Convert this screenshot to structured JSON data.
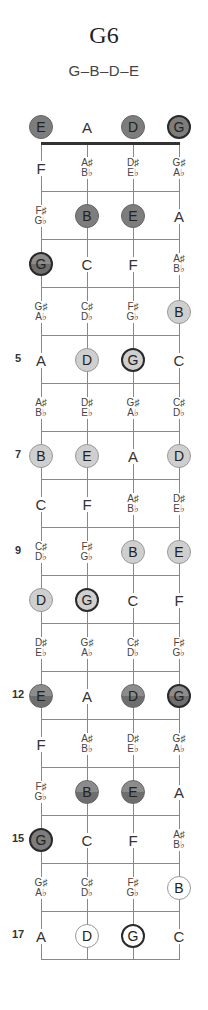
{
  "header": {
    "title": "G6",
    "notes_formula": "G–B–D–E"
  },
  "colors": {
    "dark_marker": "#7d7d7d",
    "light_marker": "#cfcfcf",
    "white_marker": "#ffffff",
    "root_border": "#2a2a2a",
    "nut": "#333333",
    "lines": "#888888"
  },
  "strings": [
    "E",
    "A",
    "D",
    "G"
  ],
  "fret_numbers": [
    {
      "fret": 5,
      "label": "5"
    },
    {
      "fret": 7,
      "label": "7"
    },
    {
      "fret": 9,
      "label": "9"
    },
    {
      "fret": 12,
      "label": "12"
    },
    {
      "fret": 15,
      "label": "15"
    },
    {
      "fret": 17,
      "label": "17"
    }
  ],
  "frets": [
    {
      "fret": 0,
      "cells": [
        {
          "label": "E",
          "marked": true,
          "style": "dark",
          "root": false
        },
        {
          "label": "A",
          "marked": false
        },
        {
          "label": "D",
          "marked": true,
          "style": "dark",
          "root": false
        },
        {
          "label": "G",
          "marked": true,
          "style": "dark",
          "root": true
        }
      ]
    },
    {
      "fret": 1,
      "cells": [
        {
          "label": "F",
          "marked": false
        },
        {
          "label": "A♯/B♭",
          "sharp": "A♯",
          "flat": "B♭",
          "marked": false
        },
        {
          "label": "D♯/E♭",
          "sharp": "D♯",
          "flat": "E♭",
          "marked": false
        },
        {
          "label": "G♯/A♭",
          "sharp": "G♯",
          "flat": "A♭",
          "marked": false
        }
      ]
    },
    {
      "fret": 2,
      "cells": [
        {
          "label": "F♯/G♭",
          "sharp": "F♯",
          "flat": "G♭",
          "marked": false
        },
        {
          "label": "B",
          "marked": true,
          "style": "dark",
          "root": false
        },
        {
          "label": "E",
          "marked": true,
          "style": "dark",
          "root": false
        },
        {
          "label": "A",
          "marked": false
        }
      ]
    },
    {
      "fret": 3,
      "cells": [
        {
          "label": "G",
          "marked": true,
          "style": "grad",
          "root": true
        },
        {
          "label": "C",
          "marked": false
        },
        {
          "label": "F",
          "marked": false
        },
        {
          "label": "A♯/B♭",
          "sharp": "A♯",
          "flat": "B♭",
          "marked": false
        }
      ]
    },
    {
      "fret": 4,
      "cells": [
        {
          "label": "G♯/A♭",
          "sharp": "G♯",
          "flat": "A♭",
          "marked": false
        },
        {
          "label": "C♯/D♭",
          "sharp": "C♯",
          "flat": "D♭",
          "marked": false
        },
        {
          "label": "F♯/G♭",
          "sharp": "F♯",
          "flat": "G♭",
          "marked": false
        },
        {
          "label": "B",
          "marked": true,
          "style": "light",
          "root": false
        }
      ]
    },
    {
      "fret": 5,
      "cells": [
        {
          "label": "A",
          "marked": false
        },
        {
          "label": "D",
          "marked": true,
          "style": "light",
          "root": false
        },
        {
          "label": "G",
          "marked": true,
          "style": "light",
          "root": true
        },
        {
          "label": "C",
          "marked": false
        }
      ]
    },
    {
      "fret": 6,
      "cells": [
        {
          "label": "A♯/B♭",
          "sharp": "A♯",
          "flat": "B♭",
          "marked": false
        },
        {
          "label": "D♯/E♭",
          "sharp": "D♯",
          "flat": "E♭",
          "marked": false
        },
        {
          "label": "G♯/A♭",
          "sharp": "G♯",
          "flat": "A♭",
          "marked": false
        },
        {
          "label": "C♯/D♭",
          "sharp": "C♯",
          "flat": "D♭",
          "marked": false
        }
      ]
    },
    {
      "fret": 7,
      "cells": [
        {
          "label": "B",
          "marked": true,
          "style": "light",
          "root": false
        },
        {
          "label": "E",
          "marked": true,
          "style": "light",
          "root": false
        },
        {
          "label": "A",
          "marked": false
        },
        {
          "label": "D",
          "marked": true,
          "style": "light",
          "root": false
        }
      ]
    },
    {
      "fret": 8,
      "cells": [
        {
          "label": "C",
          "marked": false
        },
        {
          "label": "F",
          "marked": false
        },
        {
          "label": "A♯/B♭",
          "sharp": "A♯",
          "flat": "B♭",
          "marked": false
        },
        {
          "label": "D♯/E♭",
          "sharp": "D♯",
          "flat": "E♭",
          "marked": false
        }
      ]
    },
    {
      "fret": 9,
      "cells": [
        {
          "label": "C♯/D♭",
          "sharp": "C♯",
          "flat": "D♭",
          "marked": false
        },
        {
          "label": "F♯/G♭",
          "sharp": "F♯",
          "flat": "G♭",
          "marked": false
        },
        {
          "label": "B",
          "marked": true,
          "style": "light",
          "root": false
        },
        {
          "label": "E",
          "marked": true,
          "style": "light",
          "root": false
        }
      ]
    },
    {
      "fret": 10,
      "cells": [
        {
          "label": "D",
          "marked": true,
          "style": "light",
          "root": false
        },
        {
          "label": "G",
          "marked": true,
          "style": "light",
          "root": true
        },
        {
          "label": "C",
          "marked": false
        },
        {
          "label": "F",
          "marked": false
        }
      ]
    },
    {
      "fret": 11,
      "cells": [
        {
          "label": "D♯/E♭",
          "sharp": "D♯",
          "flat": "E♭",
          "marked": false
        },
        {
          "label": "G♯/A♭",
          "sharp": "G♯",
          "flat": "A♭",
          "marked": false
        },
        {
          "label": "C♯/D♭",
          "sharp": "C♯",
          "flat": "D♭",
          "marked": false
        },
        {
          "label": "F♯/G♭",
          "sharp": "F♯",
          "flat": "G♭",
          "marked": false
        }
      ]
    },
    {
      "fret": 12,
      "cells": [
        {
          "label": "E",
          "marked": true,
          "style": "grad",
          "root": false
        },
        {
          "label": "A",
          "marked": false
        },
        {
          "label": "D",
          "marked": true,
          "style": "grad",
          "root": false
        },
        {
          "label": "G",
          "marked": true,
          "style": "grad",
          "root": true
        }
      ]
    },
    {
      "fret": 13,
      "cells": [
        {
          "label": "F",
          "marked": false
        },
        {
          "label": "A♯/B♭",
          "sharp": "A♯",
          "flat": "B♭",
          "marked": false
        },
        {
          "label": "D♯/E♭",
          "sharp": "D♯",
          "flat": "E♭",
          "marked": false
        },
        {
          "label": "G♯/A♭",
          "sharp": "G♯",
          "flat": "A♭",
          "marked": false
        }
      ]
    },
    {
      "fret": 14,
      "cells": [
        {
          "label": "F♯/G♭",
          "sharp": "F♯",
          "flat": "G♭",
          "marked": false
        },
        {
          "label": "B",
          "marked": true,
          "style": "grad",
          "root": false
        },
        {
          "label": "E",
          "marked": true,
          "style": "grad",
          "root": false
        },
        {
          "label": "A",
          "marked": false
        }
      ]
    },
    {
      "fret": 15,
      "cells": [
        {
          "label": "G",
          "marked": true,
          "style": "dark",
          "root": true
        },
        {
          "label": "C",
          "marked": false
        },
        {
          "label": "F",
          "marked": false
        },
        {
          "label": "A♯/B♭",
          "sharp": "A♯",
          "flat": "B♭",
          "marked": false
        }
      ]
    },
    {
      "fret": 16,
      "cells": [
        {
          "label": "G♯/A♭",
          "sharp": "G♯",
          "flat": "A♭",
          "marked": false
        },
        {
          "label": "C♯/D♭",
          "sharp": "C♯",
          "flat": "D♭",
          "marked": false
        },
        {
          "label": "F♯/G♭",
          "sharp": "F♯",
          "flat": "G♭",
          "marked": false
        },
        {
          "label": "B",
          "marked": true,
          "style": "white",
          "root": false
        }
      ]
    },
    {
      "fret": 17,
      "cells": [
        {
          "label": "A",
          "marked": false
        },
        {
          "label": "D",
          "marked": true,
          "style": "white",
          "root": false
        },
        {
          "label": "G",
          "marked": true,
          "style": "white",
          "root": true
        },
        {
          "label": "C",
          "marked": false
        }
      ]
    }
  ]
}
